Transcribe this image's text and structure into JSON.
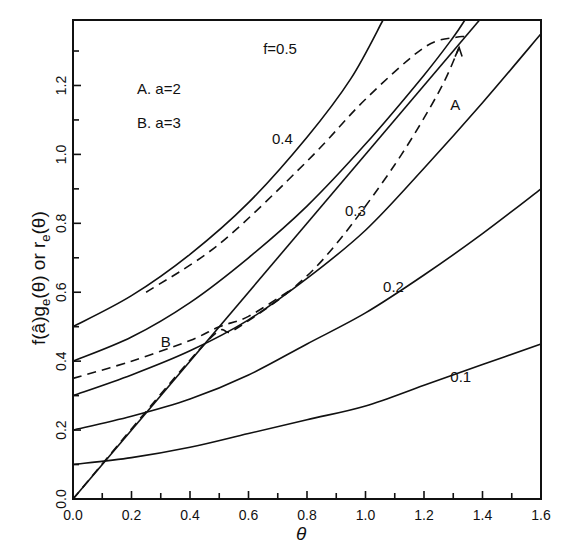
{
  "chart_data": {
    "type": "line",
    "title": "",
    "xlabel": "θ",
    "ylabel": "f(â)g_e(θ) or r_e(θ)",
    "xlim": [
      0.0,
      1.6
    ],
    "ylim": [
      0.0,
      1.39
    ],
    "grid": false,
    "x_ticks": [
      "0.0",
      "0.2",
      "0.4",
      "0.6",
      "0.8",
      "1.0",
      "1.2",
      "1.4",
      "1.6"
    ],
    "y_ticks": [
      "0.0",
      "0.2",
      "0.4",
      "0.6",
      "0.8",
      "1.0",
      "1.2"
    ],
    "legend": [
      "A. a=2",
      "B. a=3"
    ],
    "series": [
      {
        "name": "f=0.1",
        "style": "solid",
        "label": "0.1",
        "label_pos": [
          1.29,
          0.34
        ],
        "points": [
          [
            0,
            0.1
          ],
          [
            0.2,
            0.12
          ],
          [
            0.4,
            0.15
          ],
          [
            0.6,
            0.19
          ],
          [
            0.8,
            0.23
          ],
          [
            1.0,
            0.27
          ],
          [
            1.2,
            0.33
          ],
          [
            1.4,
            0.39
          ],
          [
            1.6,
            0.45
          ]
        ]
      },
      {
        "name": "f=0.2",
        "style": "solid",
        "label": "0.2",
        "label_pos": [
          1.06,
          0.6
        ],
        "points": [
          [
            0,
            0.2
          ],
          [
            0.2,
            0.24
          ],
          [
            0.4,
            0.29
          ],
          [
            0.6,
            0.36
          ],
          [
            0.8,
            0.45
          ],
          [
            1.0,
            0.54
          ],
          [
            1.2,
            0.65
          ],
          [
            1.4,
            0.77
          ],
          [
            1.6,
            0.9
          ]
        ]
      },
      {
        "name": "f=0.3",
        "style": "solid",
        "label": "0.3",
        "label_pos": [
          0.93,
          0.82
        ],
        "points": [
          [
            0,
            0.3
          ],
          [
            0.2,
            0.36
          ],
          [
            0.4,
            0.43
          ],
          [
            0.6,
            0.52
          ],
          [
            0.8,
            0.64
          ],
          [
            1.0,
            0.78
          ],
          [
            1.2,
            0.96
          ],
          [
            1.4,
            1.15
          ],
          [
            1.6,
            1.35
          ]
        ]
      },
      {
        "name": "f=0.4",
        "style": "solid",
        "label": "0.4",
        "label_pos": [
          0.68,
          1.03
        ],
        "points": [
          [
            0,
            0.4
          ],
          [
            0.2,
            0.47
          ],
          [
            0.4,
            0.57
          ],
          [
            0.6,
            0.7
          ],
          [
            0.8,
            0.85
          ],
          [
            1.0,
            1.03
          ],
          [
            1.2,
            1.23
          ],
          [
            1.3,
            1.34
          ],
          [
            1.34,
            1.39
          ]
        ]
      },
      {
        "name": "f=0.5",
        "style": "solid",
        "label": "f=0.5",
        "label_pos": [
          0.65,
          1.29
        ],
        "points": [
          [
            0,
            0.5
          ],
          [
            0.2,
            0.59
          ],
          [
            0.4,
            0.71
          ],
          [
            0.6,
            0.86
          ],
          [
            0.8,
            1.05
          ],
          [
            0.95,
            1.22
          ],
          [
            1.06,
            1.39
          ]
        ]
      },
      {
        "name": "r_e(θ)",
        "style": "solid",
        "label": "",
        "points": [
          [
            0,
            0
          ],
          [
            1.39,
            1.39
          ]
        ]
      },
      {
        "name": "A (a=2)",
        "style": "dashed",
        "label": "A",
        "label_pos": [
          1.29,
          1.13
        ],
        "points": [
          [
            0,
            0
          ],
          [
            0.45,
            0.45
          ],
          [
            0.55,
            0.49
          ],
          [
            0.75,
            0.61
          ],
          [
            0.9,
            0.74
          ],
          [
            1.1,
            0.97
          ],
          [
            1.25,
            1.18
          ],
          [
            1.32,
            1.31
          ]
        ]
      },
      {
        "name": "A upper branch",
        "style": "dashed",
        "label": "",
        "points": [
          [
            0.25,
            0.6
          ],
          [
            0.5,
            0.74
          ],
          [
            0.8,
            0.98
          ],
          [
            1.0,
            1.16
          ],
          [
            1.2,
            1.31
          ],
          [
            1.31,
            1.34
          ],
          [
            1.35,
            1.34
          ]
        ]
      },
      {
        "name": "B (a=3)",
        "style": "dashed",
        "label": "B",
        "label_pos": [
          0.3,
          0.44
        ],
        "points": [
          [
            0,
            0.35
          ],
          [
            0.2,
            0.4
          ],
          [
            0.4,
            0.46
          ],
          [
            0.5,
            0.5
          ],
          [
            0.6,
            0.53
          ],
          [
            0.75,
            0.61
          ]
        ]
      }
    ]
  },
  "labels": {
    "legend_a": "A. a=2",
    "legend_b": "B. a=3",
    "xlabel": "θ",
    "ylabel_main": "f(â)g",
    "ylabel_sub1": "e",
    "ylabel_mid": "(θ) or r",
    "ylabel_sub2": "e",
    "ylabel_end": "(θ)"
  }
}
